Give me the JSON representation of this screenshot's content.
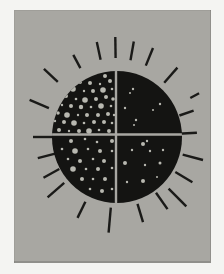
{
  "artwork": {
    "description": "Black circular sun divided into four quadrants by thin gray lines, each quadrant holding scattered light-gray dots (stars) of different densities, surrounded by short radiating black brush strokes, printed on a gray panel with a white paper border",
    "colors": {
      "page_background": "#f4f4f2",
      "panel_background": "#a8a7a2",
      "sun_fill": "#141412",
      "ray_stroke": "#1a1a18",
      "dot_fill": "#b8b8b0",
      "divider": "#a8a7a2"
    },
    "canvas": {
      "width": 224,
      "height": 274
    },
    "panel": {
      "x": 14,
      "y": 10,
      "width": 197,
      "height": 253
    },
    "sun": {
      "cx": 117,
      "cy": 137,
      "rx": 65,
      "ry": 66
    },
    "dividers": {
      "vertical_x": 116,
      "horizontal_y": 134.5,
      "thickness": 2.4
    },
    "ray_width": 2.4,
    "rays": [
      {
        "angle": -157,
        "r1": 74,
        "r2": 95
      },
      {
        "angle": -137,
        "r1": 81,
        "r2": 100
      },
      {
        "angle": -118,
        "r1": 78,
        "r2": 93
      },
      {
        "angle": -102,
        "r1": 79,
        "r2": 97
      },
      {
        "angle": -91,
        "r1": 79,
        "r2": 100
      },
      {
        "angle": -80,
        "r1": 78,
        "r2": 97
      },
      {
        "angle": -68,
        "r1": 77,
        "r2": 96
      },
      {
        "angle": -49,
        "r1": 72,
        "r2": 92
      },
      {
        "angle": -28,
        "r1": 83,
        "r2": 93
      },
      {
        "angle": -19,
        "r1": 66,
        "r2": 81
      },
      {
        "angle": -3,
        "r1": 61,
        "r2": 80
      },
      {
        "angle": 15,
        "r1": 68,
        "r2": 89
      },
      {
        "angle": 31,
        "r1": 68,
        "r2": 88
      },
      {
        "angle": 45,
        "r1": 73,
        "r2": 98
      },
      {
        "angle": 55,
        "r1": 68,
        "r2": 88
      },
      {
        "angle": 73,
        "r1": 70,
        "r2": 89
      },
      {
        "angle": 95,
        "r1": 71,
        "r2": 96
      },
      {
        "angle": 116,
        "r1": 72,
        "r2": 90
      },
      {
        "angle": 139,
        "r1": 70,
        "r2": 92
      },
      {
        "angle": 151,
        "r1": 66,
        "r2": 84
      },
      {
        "angle": 165,
        "r1": 64,
        "r2": 82
      },
      {
        "angle": 180,
        "r1": 62,
        "r2": 84
      }
    ],
    "stars": {
      "top_left": [
        [
          86,
          75,
          1.5
        ],
        [
          95,
          73,
          1.2
        ],
        [
          105,
          76,
          2
        ],
        [
          80,
          82,
          2
        ],
        [
          90,
          83,
          2
        ],
        [
          100,
          84,
          1.2
        ],
        [
          110,
          81,
          2
        ],
        [
          73,
          89,
          2.8
        ],
        [
          84,
          91,
          1.2
        ],
        [
          93,
          91,
          2
        ],
        [
          103,
          90,
          2.8
        ],
        [
          112,
          89,
          1.3
        ],
        [
          66,
          96,
          2
        ],
        [
          76,
          99,
          1.3
        ],
        [
          85,
          100,
          2.8
        ],
        [
          96,
          99,
          2
        ],
        [
          106,
          97,
          2
        ],
        [
          113,
          99,
          1.8
        ],
        [
          62,
          105,
          1.2
        ],
        [
          71,
          106,
          2
        ],
        [
          81,
          107,
          2.2
        ],
        [
          91,
          107,
          1.3
        ],
        [
          101,
          106,
          2.8
        ],
        [
          111,
          106,
          1.3
        ],
        [
          58,
          113,
          1.8
        ],
        [
          67,
          115,
          2.8
        ],
        [
          78,
          115,
          1.2
        ],
        [
          87,
          115,
          2
        ],
        [
          98,
          115,
          2
        ],
        [
          108,
          114,
          2
        ],
        [
          114,
          115,
          1.2
        ],
        [
          55,
          121,
          1.2
        ],
        [
          64,
          122,
          2
        ],
        [
          74,
          123,
          2.8
        ],
        [
          84,
          123,
          1.3
        ],
        [
          94,
          122,
          2
        ],
        [
          104,
          122,
          2
        ],
        [
          112,
          123,
          1.3
        ],
        [
          59,
          130,
          2
        ],
        [
          69,
          131,
          1.2
        ],
        [
          79,
          131,
          2
        ],
        [
          89,
          131,
          2.8
        ],
        [
          99,
          130,
          1.3
        ],
        [
          109,
          131,
          2
        ]
      ],
      "top_right": [
        [
          133,
          89,
          1.2
        ],
        [
          130,
          93,
          1
        ],
        [
          160,
          104,
          1.2
        ],
        [
          125,
          108,
          1.2
        ],
        [
          153,
          110,
          1
        ],
        [
          136,
          120,
          1.2
        ],
        [
          134,
          125,
          1
        ]
      ],
      "bottom_left": [
        [
          71,
          141,
          2
        ],
        [
          85,
          139,
          1.3
        ],
        [
          97,
          142,
          1.3
        ],
        [
          112,
          141,
          2
        ],
        [
          62,
          149,
          1.3
        ],
        [
          75,
          151,
          2.8
        ],
        [
          88,
          149,
          1.3
        ],
        [
          100,
          151,
          2
        ],
        [
          112,
          151,
          1.3
        ],
        [
          68,
          159,
          1.3
        ],
        [
          80,
          161,
          2
        ],
        [
          93,
          159,
          1.3
        ],
        [
          104,
          161,
          2
        ],
        [
          73,
          169,
          2.8
        ],
        [
          86,
          169,
          1.3
        ],
        [
          98,
          169,
          2
        ],
        [
          112,
          168,
          1.3
        ],
        [
          82,
          179,
          2
        ],
        [
          93,
          179,
          1.3
        ],
        [
          105,
          179,
          2
        ],
        [
          90,
          189,
          1.3
        ],
        [
          102,
          191,
          2
        ],
        [
          112,
          189,
          1.3
        ]
      ],
      "bottom_right": [
        [
          143,
          144,
          2
        ],
        [
          147,
          141,
          1.2
        ],
        [
          132,
          150,
          1.2
        ],
        [
          150,
          151,
          1.2
        ],
        [
          163,
          150,
          1.2
        ],
        [
          125,
          163,
          2
        ],
        [
          145,
          165,
          1.2
        ],
        [
          160,
          163,
          1.5
        ],
        [
          157,
          177,
          1
        ],
        [
          143,
          181,
          2
        ],
        [
          127,
          182,
          1.2
        ]
      ]
    }
  }
}
